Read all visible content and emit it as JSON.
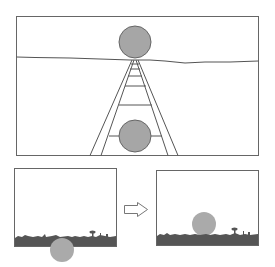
{
  "figure": {
    "colors": {
      "background": "#ffffff",
      "frame": "#666666",
      "line": "#555555",
      "circle_fill": "#a6a6a6",
      "circle_stroke": "#666666",
      "ground": "#555555",
      "moon_fill": "#aaaaaa"
    },
    "top_panel": {
      "label": "railway-track-perspective",
      "circles": [
        {
          "id": "upper",
          "cx": 135,
          "cy": 42,
          "r": 16
        },
        {
          "id": "lower",
          "cx": 135,
          "cy": 136,
          "r": 16
        }
      ],
      "rungs_count": 6
    },
    "bottom_left_panel": {
      "label": "moon-at-horizon",
      "moon": {
        "cx": 62,
        "cy": 250,
        "r": 12
      }
    },
    "arrow": {
      "direction": "right",
      "icon": "right-arrow-icon"
    },
    "bottom_right_panel": {
      "label": "moon-risen",
      "moon": {
        "cx": 204,
        "cy": 224,
        "r": 12
      }
    }
  }
}
